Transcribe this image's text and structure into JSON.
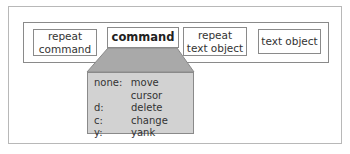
{
  "diagram": {
    "boxes": [
      {
        "id": "repeat-command",
        "label_line1": "repeat",
        "label_line2": "command"
      },
      {
        "id": "command",
        "label": "command",
        "emphasized": true
      },
      {
        "id": "repeat-text-object",
        "label_line1": "repeat",
        "label_line2": "text object"
      },
      {
        "id": "text-object",
        "label": "text object"
      }
    ],
    "command_table": [
      {
        "key": "none:",
        "value": "move cursor"
      },
      {
        "key": "d:",
        "value": "delete"
      },
      {
        "key": "c:",
        "value": "change"
      },
      {
        "key": "y:",
        "value": "yank"
      }
    ],
    "colors": {
      "panel_fill": "#d2d2d2",
      "trapezoid_fill": "#a9a9a9",
      "border": "#8a8a8a"
    }
  }
}
